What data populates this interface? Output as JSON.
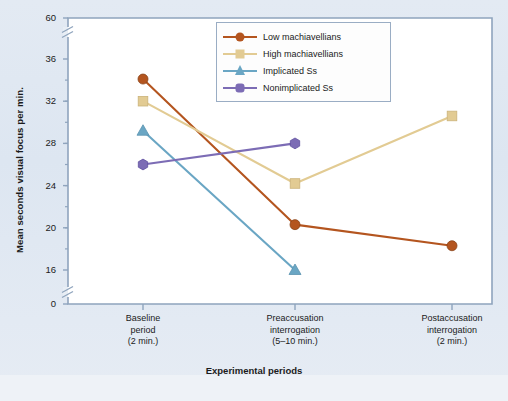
{
  "chart_data": {
    "type": "line",
    "title": "",
    "xlabel": "Experimental periods",
    "ylabel": "Mean seconds visual focus per min.",
    "categories": [
      "Baseline\nperiod\n(2 min.)",
      "Preaccusation\ninterrogation\n(5–10 min.)",
      "Postaccusation\ninterrogation\n(2 min.)"
    ],
    "ylim": [
      16,
      36
    ],
    "ytick_labels": [
      "60",
      "36",
      "32",
      "28",
      "24",
      "20",
      "16",
      "0"
    ],
    "yticks": [
      36,
      32,
      28,
      24,
      20,
      16
    ],
    "axis_break_top": true,
    "axis_break_bottom": true,
    "grid": false,
    "legend_position": "top-center",
    "series": [
      {
        "name": "Low machiavellians",
        "color": "#b4551f",
        "marker": "circle",
        "values": [
          34.1,
          20.3,
          18.3
        ]
      },
      {
        "name": "High machiavellians",
        "color": "#e2cb93",
        "marker": "square",
        "values": [
          32.0,
          24.2,
          30.6
        ]
      },
      {
        "name": "Implicated Ss",
        "color": "#6aa6c4",
        "marker": "triangle",
        "values": [
          29.2,
          16.0,
          null
        ]
      },
      {
        "name": "Nonimplicated Ss",
        "color": "#7c6cb5",
        "marker": "hexagon",
        "values": [
          26.0,
          28.0,
          null
        ]
      }
    ]
  },
  "xtick_labels": [
    [
      "Baseline",
      "period",
      "(2 min.)"
    ],
    [
      "Preaccusation",
      "interrogation",
      "(5–10 min.)"
    ],
    [
      "Postaccusation",
      "interrogation",
      "(2 min.)"
    ]
  ],
  "colors": {
    "page_background": "#dfe7f0",
    "plot_background": "#ffffff",
    "axis": "#8fa4bd",
    "text": "#1b1b1b",
    "legend_border": "#9aadc4"
  }
}
